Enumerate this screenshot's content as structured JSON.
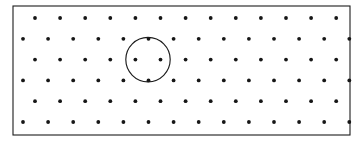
{
  "figure": {
    "background_color": "#ffffff",
    "ink_color": "#161616",
    "stroke_color": "#1c1c1c",
    "width": 359,
    "height": 144
  },
  "frame": {
    "label": "rectangular border",
    "x": 13,
    "y": 6,
    "width": 337,
    "height": 129,
    "stroke_width": 1.1
  },
  "lattice": {
    "label": "offset dot lattice",
    "dot_radius": 1.9,
    "column_pitch": 25.1,
    "row_pitch": 20.8,
    "row_count": 6,
    "rows": [
      {
        "index": 1,
        "y": 18.0,
        "x_start": 35.0,
        "count": 13,
        "offset": "aligned"
      },
      {
        "index": 2,
        "y": 38.8,
        "x_start": 23.0,
        "count": 14,
        "offset": "shifted"
      },
      {
        "index": 3,
        "y": 59.6,
        "x_start": 35.0,
        "count": 13,
        "offset": "aligned"
      },
      {
        "index": 4,
        "y": 80.4,
        "x_start": 23.0,
        "count": 14,
        "offset": "shifted"
      },
      {
        "index": 5,
        "y": 101.2,
        "x_start": 35.0,
        "count": 13,
        "offset": "aligned"
      },
      {
        "index": 6,
        "y": 122.0,
        "x_start": 23.0,
        "count": 14,
        "offset": "shifted"
      }
    ]
  },
  "highlight_circle": {
    "label": "circle through six nearest neighbours",
    "center_x": 148.0,
    "center_y": 59.6,
    "radius": 22.2,
    "stroke_width": 1.15,
    "dots_on_circumference": 6,
    "dots_at_center": 1
  }
}
